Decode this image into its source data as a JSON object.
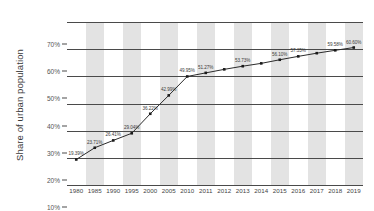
{
  "chart_data": {
    "type": "line",
    "title": "",
    "subtitle": "",
    "xlabel": "",
    "ylabel": "Share of urban population",
    "ylim": [
      10,
      70
    ],
    "y_ticks": [
      "10%",
      "20%",
      "30%",
      "40%",
      "50%",
      "60%",
      "70%"
    ],
    "y_tick_values": [
      10,
      20,
      30,
      40,
      50,
      60,
      70
    ],
    "grid": true,
    "legend": false,
    "legend_position": "none",
    "banded_background": true,
    "marker": "square",
    "line_color": "#2b2b2b",
    "marker_color": "#1a1a1a",
    "band_color": "#e3e3e3",
    "categories": [
      "1980",
      "1985",
      "1990",
      "1995",
      "2000",
      "2005",
      "2010",
      "2011",
      "2012",
      "2013",
      "2014",
      "2015",
      "2016",
      "2017",
      "2018",
      "2019"
    ],
    "values": [
      19.39,
      23.71,
      26.41,
      29.04,
      36.22,
      42.99,
      49.95,
      51.27,
      52.57,
      53.73,
      54.77,
      56.1,
      57.35,
      58.52,
      59.58,
      60.6
    ],
    "point_labels": [
      "19.39%",
      "23.71%",
      "26.41%",
      "29.04%",
      "36.22%",
      "42.99%",
      "49.95%",
      "51.27%",
      "",
      "53.73%",
      "",
      "56.10%",
      "57.35%",
      "",
      "59.58%",
      "60.60%"
    ]
  }
}
